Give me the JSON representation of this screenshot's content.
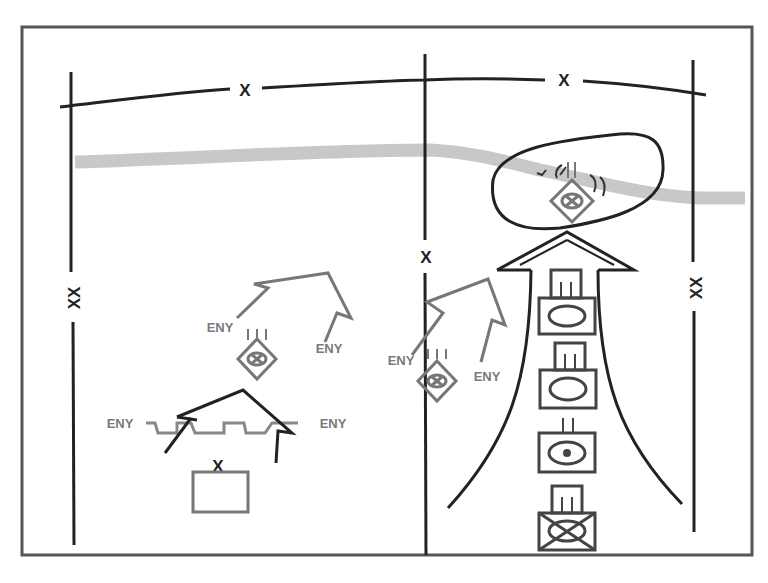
{
  "diagram": {
    "type": "tactical-overlay",
    "colors": {
      "friendly": "#222222",
      "enemy": "#777777",
      "river": "#c8c8c8",
      "frame": "#555555",
      "background": "#ffffff"
    },
    "boundaries": {
      "top_company_label_left": "X",
      "top_company_label_right": "X",
      "left_division_label": "XX",
      "right_division_label": "XX",
      "center_brigade_label": "X"
    },
    "enemy_labels": {
      "left_attack_a": "ENY",
      "left_attack_b": "ENY",
      "center_attack_a": "ENY",
      "center_attack_b": "ENY",
      "obstacle_left": "ENY",
      "obstacle_right": "ENY"
    },
    "enemy_units": [
      {
        "name": "enemy-mech-regiment-left",
        "echelon": "III",
        "symbol": "armor-mech-diamond"
      },
      {
        "name": "enemy-mech-regiment-center",
        "echelon": "III",
        "symbol": "armor-mech-diamond"
      },
      {
        "name": "enemy-mech-regiment-objective",
        "echelon": "III",
        "symbol": "armor-mech-diamond"
      }
    ],
    "friendly_units": [
      {
        "name": "armor-battalion-1",
        "echelon": "III",
        "symbol": "armor"
      },
      {
        "name": "armor-battalion-2",
        "echelon": "III",
        "symbol": "armor"
      },
      {
        "name": "recon-company",
        "echelon": "II",
        "symbol": "armor-recon"
      },
      {
        "name": "mech-infantry-battalion",
        "echelon": "III",
        "symbol": "mech-infantry"
      }
    ],
    "brigade_reserve": {
      "echelon": "X",
      "symbol": "empty-unit-box"
    }
  }
}
